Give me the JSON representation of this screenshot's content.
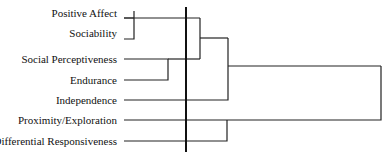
{
  "diagram": {
    "type": "dendrogram",
    "leaves": [
      {
        "label": "Positive Affect",
        "y": 13
      },
      {
        "label": "Sociability",
        "y": 33
      },
      {
        "label": "Social Perceptiveness",
        "y": 59
      },
      {
        "label": "Endurance",
        "y": 80
      },
      {
        "label": "Independence",
        "y": 100
      },
      {
        "label": "Proximity/Exploration",
        "y": 120
      },
      {
        "label": "Differential Responsiveness",
        "y": 141
      }
    ],
    "line_color": "#222222",
    "cutoff_line_x": 186
  }
}
